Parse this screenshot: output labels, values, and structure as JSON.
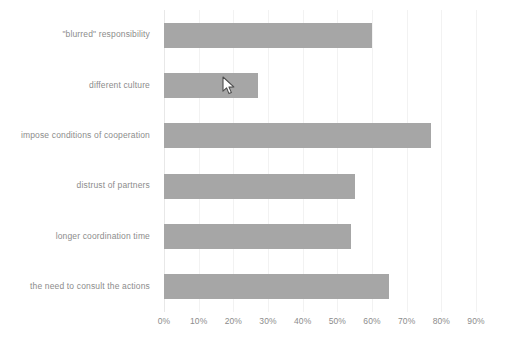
{
  "chart_data": {
    "type": "bar",
    "orientation": "horizontal",
    "title": "",
    "xlabel": "",
    "ylabel": "",
    "xlim": [
      0,
      90
    ],
    "grid": true,
    "legend": false,
    "tick_suffix": "%",
    "tick_labels": [
      "0%",
      "10%",
      "20%",
      "30%",
      "40%",
      "50%",
      "60%",
      "70%",
      "80%",
      "90%"
    ],
    "tick_values": [
      0,
      10,
      20,
      30,
      40,
      50,
      60,
      70,
      80,
      90
    ],
    "categories": [
      "\"blurred\" responsibility",
      "different culture",
      "impose conditions of cooperation",
      "distrust of partners",
      "longer coordination time",
      "the need to consult the actions"
    ],
    "values": [
      60,
      27,
      77,
      55,
      54,
      65
    ],
    "bar_color": "#a6a6a6",
    "gridline_color": "#f2f2f2",
    "text_color": "#8c8c8c"
  },
  "cursor": {
    "name": "mouse-pointer",
    "x": 227,
    "y": 84
  }
}
